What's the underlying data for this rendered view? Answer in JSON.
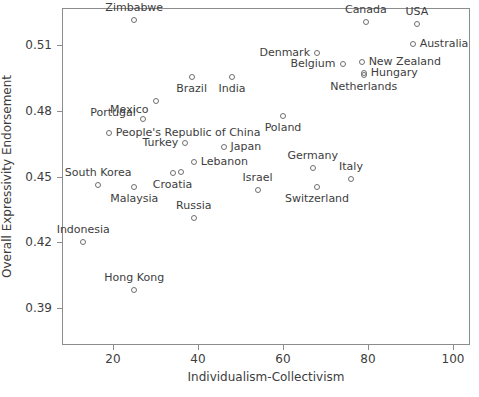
{
  "chart_data": {
    "type": "scatter",
    "title": "",
    "xlabel": "Individualism-Collectivism",
    "ylabel": "Overall Expressivity Endorsement",
    "xlim": [
      8,
      104
    ],
    "ylim": [
      0.373,
      0.527
    ],
    "xticks": [
      20,
      40,
      60,
      80,
      100
    ],
    "yticks": [
      "0.39",
      "0.42",
      "0.45",
      "0.48",
      "0.51"
    ],
    "grid": false,
    "legend": "none",
    "marker": "open-circle",
    "points": [
      {
        "label": "Zimbabwe",
        "x": 25,
        "y": 0.5215,
        "pos": "above"
      },
      {
        "label": "Canada",
        "x": 79.5,
        "y": 0.5205,
        "pos": "above"
      },
      {
        "label": "USA",
        "x": 91.5,
        "y": 0.5195,
        "pos": "above"
      },
      {
        "label": "Australia",
        "x": 90.5,
        "y": 0.5105,
        "pos": "right"
      },
      {
        "label": "Denmark",
        "x": 68,
        "y": 0.5065,
        "pos": "left"
      },
      {
        "label": "New Zealand",
        "x": 78.5,
        "y": 0.5025,
        "pos": "right"
      },
      {
        "label": "Belgium",
        "x": 74,
        "y": 0.5015,
        "pos": "left"
      },
      {
        "label": "Hungary",
        "x": 79,
        "y": 0.4975,
        "pos": "right"
      },
      {
        "label": "Netherlands",
        "x": 79,
        "y": 0.4965,
        "pos": "below"
      },
      {
        "label": "Brazil",
        "x": 38.5,
        "y": 0.4955,
        "pos": "below"
      },
      {
        "label": "India",
        "x": 48,
        "y": 0.4955,
        "pos": "below"
      },
      {
        "label": "Mexico",
        "x": 30,
        "y": 0.4845,
        "pos": "below-left"
      },
      {
        "label": "Portugal",
        "x": 27,
        "y": 0.4765,
        "pos": "above-left"
      },
      {
        "label": "Poland",
        "x": 60,
        "y": 0.4775,
        "pos": "below"
      },
      {
        "label": "People's Republic of China",
        "x": 19,
        "y": 0.47,
        "pos": "right"
      },
      {
        "label": "Turkey",
        "x": 37,
        "y": 0.4655,
        "pos": "left"
      },
      {
        "label": "Japan",
        "x": 46,
        "y": 0.4635,
        "pos": "right"
      },
      {
        "label": "Lebanon",
        "x": 39,
        "y": 0.4565,
        "pos": "right"
      },
      {
        "label": "Croatia",
        "x": 34,
        "y": 0.4515,
        "pos": "below"
      },
      {
        "label": "Croatia-pair",
        "x": 36,
        "y": 0.452,
        "pos": "none"
      },
      {
        "label": "Germany",
        "x": 67,
        "y": 0.454,
        "pos": "above"
      },
      {
        "label": "Italy",
        "x": 76,
        "y": 0.449,
        "pos": "above"
      },
      {
        "label": "South Korea",
        "x": 16.5,
        "y": 0.446,
        "pos": "above"
      },
      {
        "label": "Malaysia",
        "x": 25,
        "y": 0.445,
        "pos": "below"
      },
      {
        "label": "Israel",
        "x": 54,
        "y": 0.444,
        "pos": "above"
      },
      {
        "label": "Switzerland",
        "x": 68,
        "y": 0.445,
        "pos": "below"
      },
      {
        "label": "Russia",
        "x": 39,
        "y": 0.431,
        "pos": "above"
      },
      {
        "label": "Indonesia",
        "x": 13,
        "y": 0.42,
        "pos": "above"
      },
      {
        "label": "Hong Kong",
        "x": 25,
        "y": 0.398,
        "pos": "above"
      }
    ]
  }
}
